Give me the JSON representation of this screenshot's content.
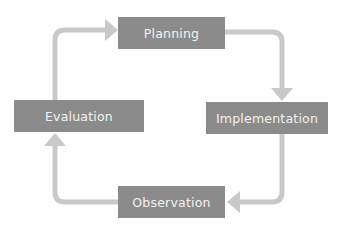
{
  "diagram": {
    "type": "cycle",
    "colors": {
      "box_fill": "#8b8b8b",
      "box_text": "#f2f2f2",
      "connector": "#c9c9c9",
      "background": "#ffffff"
    },
    "stages": [
      {
        "id": "planning",
        "label": "Planning"
      },
      {
        "id": "implementation",
        "label": "Implementation"
      },
      {
        "id": "observation",
        "label": "Observation"
      },
      {
        "id": "evaluation",
        "label": "Evaluation"
      }
    ],
    "connectors": [
      {
        "from": "planning",
        "to": "implementation",
        "direction": "clockwise"
      },
      {
        "from": "implementation",
        "to": "observation",
        "direction": "clockwise"
      },
      {
        "from": "observation",
        "to": "evaluation",
        "direction": "clockwise"
      },
      {
        "from": "evaluation",
        "to": "planning",
        "direction": "clockwise"
      }
    ]
  }
}
